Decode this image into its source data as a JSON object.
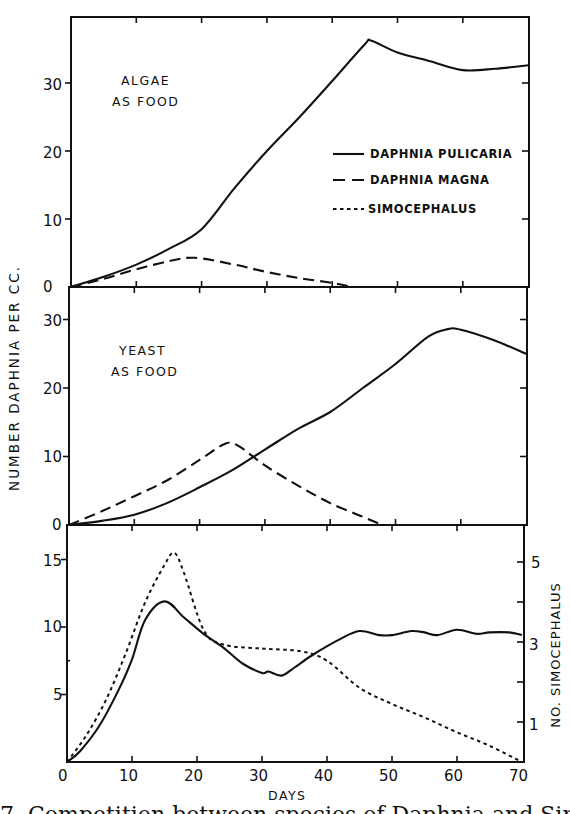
{
  "figure": {
    "caption_partial": "7.  Competition between species of Daphnia and Simocephalus",
    "y_axis_label": "NUMBER DAPHNIA PER CC.",
    "y2_axis_label": "NO. SIMOCEPHALUS",
    "x_axis_label": "DAYS",
    "panel_labels": {
      "top_line1": "ALGAE",
      "top_line2": "AS FOOD",
      "middle_line1": "YEAST",
      "middle_line2": "AS FOOD"
    },
    "legend": {
      "pulicaria": "DAPHNIA  PULICARIA",
      "magna": "DAPHNIA  MAGNA",
      "simocephalus": "SIMOCEPHALUS"
    },
    "x_ticks": [
      "0",
      "10",
      "20",
      "30",
      "40",
      "50",
      "60",
      "70"
    ],
    "top_y_ticks": [
      "0",
      "10",
      "20",
      "30"
    ],
    "middle_y_ticks": [
      "0",
      "10",
      "20",
      "30"
    ],
    "bottom_y_ticks": [
      "5",
      "10",
      "15"
    ],
    "bottom_y2_ticks": [
      "1",
      "3",
      "5"
    ]
  },
  "chart_data": [
    {
      "type": "line",
      "title": "Algae as food",
      "xlabel": "DAYS",
      "ylabel": "NUMBER DAPHNIA PER CC.",
      "xlim": [
        0,
        70
      ],
      "ylim": [
        0,
        40
      ],
      "grid": false,
      "legend_position": "right-center",
      "series": [
        {
          "name": "Daphnia pulicaria",
          "style": "solid",
          "x": [
            0,
            5,
            10,
            15,
            20,
            25,
            30,
            35,
            40,
            45,
            46,
            50,
            55,
            60,
            65,
            70
          ],
          "y": [
            0,
            1.5,
            3.3,
            5.6,
            8.5,
            14.5,
            20,
            25,
            30.3,
            35.7,
            36.2,
            34.5,
            33.2,
            31.9,
            32.1,
            32.6
          ]
        },
        {
          "name": "Daphnia magna",
          "style": "dashed",
          "x": [
            0,
            5,
            10,
            15,
            19,
            25,
            30,
            35,
            40,
            43
          ],
          "y": [
            0,
            1.2,
            2.6,
            3.8,
            4.3,
            3.3,
            2.2,
            1.3,
            0.6,
            0
          ]
        }
      ]
    },
    {
      "type": "line",
      "title": "Yeast as food",
      "xlabel": "DAYS",
      "ylabel": "NUMBER DAPHNIA PER CC.",
      "xlim": [
        0,
        70
      ],
      "ylim": [
        0,
        35
      ],
      "grid": false,
      "series": [
        {
          "name": "Daphnia pulicaria",
          "style": "solid",
          "x": [
            0,
            5,
            10,
            15,
            20,
            25,
            30,
            35,
            40,
            45,
            50,
            55,
            58,
            60,
            65,
            70
          ],
          "y": [
            0,
            0.6,
            1.5,
            3.2,
            5.5,
            8,
            11,
            14,
            16.5,
            20,
            23.5,
            27.5,
            28.6,
            28.5,
            27,
            25
          ]
        },
        {
          "name": "Daphnia magna",
          "style": "dashed",
          "x": [
            0,
            5,
            10,
            15,
            20,
            24,
            26,
            30,
            35,
            40,
            45,
            48
          ],
          "y": [
            0,
            2,
            4.2,
            6.5,
            9.5,
            11.9,
            11.5,
            8.7,
            5.8,
            3.2,
            1.2,
            0
          ]
        }
      ]
    },
    {
      "type": "line",
      "title": "Daphnia pulicaria vs Simocephalus",
      "xlabel": "DAYS",
      "ylabel": "NUMBER DAPHNIA PER CC.",
      "y2label": "NO. SIMOCEPHALUS",
      "xlim": [
        0,
        70
      ],
      "ylim": [
        0,
        17
      ],
      "y2lim": [
        0,
        5.5
      ],
      "grid": false,
      "series": [
        {
          "name": "Daphnia pulicaria",
          "style": "solid",
          "axis": "left",
          "x": [
            0,
            2,
            5,
            8,
            10,
            12,
            15,
            18,
            21,
            24,
            27,
            30,
            31,
            33,
            35,
            38,
            42,
            45,
            48,
            50,
            53,
            55,
            57,
            60,
            63,
            65,
            68,
            70
          ],
          "y": [
            0,
            0.8,
            2.7,
            5.4,
            7.6,
            10.5,
            11.9,
            10.7,
            9.5,
            8.5,
            7.3,
            6.6,
            6.7,
            6.4,
            7.0,
            8.0,
            9.1,
            9.7,
            9.4,
            9.4,
            9.7,
            9.6,
            9.4,
            9.8,
            9.5,
            9.6,
            9.6,
            9.4
          ]
        },
        {
          "name": "Simocephalus",
          "style": "dotted",
          "axis": "left-scaled",
          "x": [
            0,
            3,
            6,
            9,
            12,
            15,
            16.5,
            18,
            21,
            24,
            30,
            36,
            40,
            45,
            50,
            55,
            60,
            65,
            70
          ],
          "y": [
            0,
            2.0,
            4.6,
            8.0,
            11.8,
            14.6,
            15.5,
            14.0,
            9.8,
            8.7,
            8.4,
            8.2,
            7.5,
            5.5,
            4.3,
            3.3,
            2.2,
            1.2,
            0
          ]
        }
      ]
    }
  ]
}
